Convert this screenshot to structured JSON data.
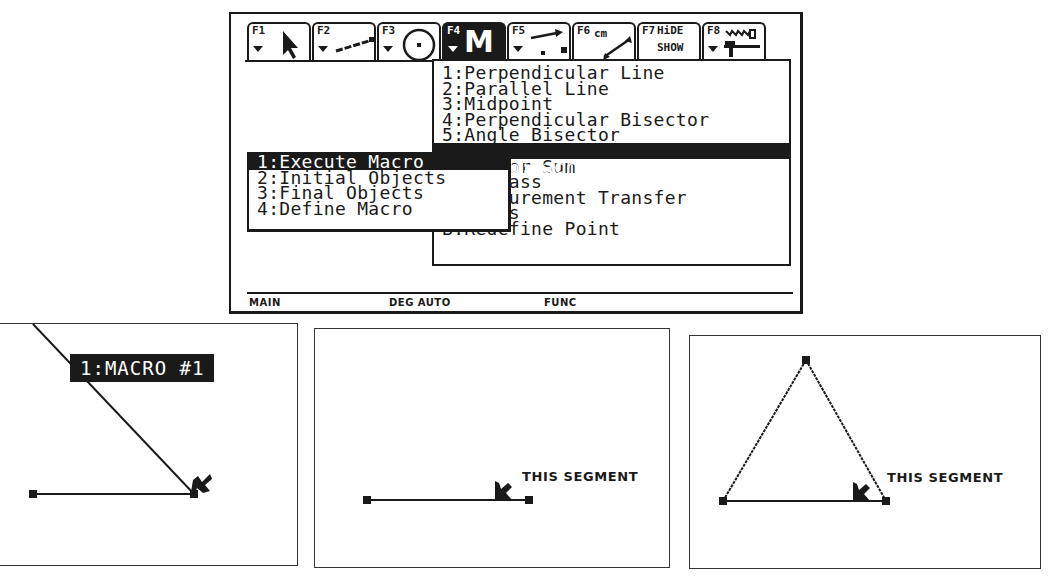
{
  "screen": {
    "toolbar": [
      {
        "key": "F1",
        "icon": "pointer-arrow-icon"
      },
      {
        "key": "F2",
        "icon": "line-segment-icon"
      },
      {
        "key": "F3",
        "icon": "circle-icon"
      },
      {
        "key": "F4",
        "icon": "macro-m-icon",
        "glyph": "M",
        "active": true
      },
      {
        "key": "F5",
        "icon": "measure-icon"
      },
      {
        "key": "F6",
        "icon": "vector-cm-icon",
        "sub": "cm"
      },
      {
        "key": "F7",
        "icon": "hide-show-icon",
        "line1": "HiDE",
        "line2": "SHOW"
      },
      {
        "key": "F8",
        "icon": "hammer-saw-icon"
      }
    ],
    "constructions_menu": {
      "items": [
        "1:Perpendicular Line",
        "2:Parallel Line",
        "3:Midpoint",
        "4:Perpendicular Bisector",
        "5:Angle Bisector",
        "6:Macro Construction",
        "7:Vector Sum",
        "8:Compass",
        "9:Measurement Transfer",
        "A:Locus",
        "B:Redefine Point"
      ],
      "visible_fragments": {
        "item6": "ro Construction",
        "item7": "tor Sum",
        "item8": "pass",
        "item9": "surement Transfer",
        "item10": "A:Locus"
      },
      "selected_index": 5
    },
    "macro_submenu": {
      "items": [
        "1:Execute Macro",
        "2:Initial Objects",
        "3:Final Objects",
        "4:Define Macro"
      ],
      "selected_index": 0
    },
    "status_bar": {
      "mode": "MAIN",
      "angle": "DEG AUTO",
      "graph": "FUNC"
    }
  },
  "panels": [
    {
      "macro_label": "1:MACRO #1"
    },
    {
      "segment_label": "THIS SEGMENT"
    },
    {
      "segment_label": "THIS SEGMENT"
    }
  ]
}
